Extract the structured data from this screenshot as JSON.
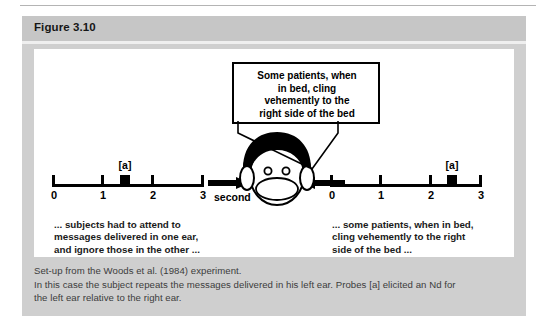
{
  "figure": {
    "header_label": "Figure 3.10"
  },
  "callout": {
    "lines": [
      "Some patients, when",
      "in bed, cling",
      "vehemently to the",
      "right side of the bed"
    ]
  },
  "center": {
    "second_label": "second",
    "head_icon": "head-face-icon",
    "arrow_left_icon": "arrow-right-pointing-icon",
    "arrow_right_icon": "arrow-left-pointing-icon"
  },
  "scales": [
    {
      "id": "left",
      "tick_labels": [
        "0",
        "1",
        "2",
        "3"
      ],
      "tick_values": [
        0,
        1,
        2,
        3
      ],
      "axis_min": 0,
      "axis_max": 3,
      "probe_label": "[a]",
      "probe_value": 1.45,
      "caption_lines": [
        "... subjects had to attend to",
        "messages delivered in one ear,",
        "and ignore those in the other ..."
      ]
    },
    {
      "id": "right",
      "tick_labels": [
        "0",
        "1",
        "2",
        "3"
      ],
      "tick_values": [
        0,
        1,
        2,
        3
      ],
      "axis_min": 0,
      "axis_max": 3,
      "probe_label": "[a]",
      "probe_value": 2.44,
      "caption_lines": [
        "... some patients, when in bed,",
        "cling vehemently to the right",
        "side of the bed ..."
      ]
    }
  ],
  "caption": {
    "lines": [
      "Set-up from the Woods et al. (1984) experiment.",
      "In this case the subject repeats the messages delivered in his left ear. Probes [a] elicited an Nd for",
      "the left ear relative to the right ear."
    ]
  },
  "colors": {
    "panel_bg": "#cfcfcf",
    "header_bg": "#c6c6c6",
    "artwork_bg": "#ffffff",
    "ink": "#000000",
    "caption_text": "#3c3c3c"
  }
}
